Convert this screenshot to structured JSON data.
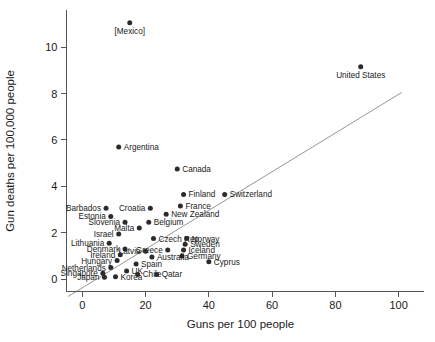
{
  "chart_data": {
    "type": "scatter",
    "title": "",
    "xlabel": "Guns per 100 people",
    "ylabel": "Gun deaths per 100,000 people",
    "xlim": [
      -8,
      108
    ],
    "ylim": [
      -0.9,
      11.6
    ],
    "xticks": [
      0,
      20,
      40,
      60,
      80,
      100
    ],
    "yticks": [
      0,
      2,
      4,
      6,
      8,
      10
    ],
    "xtick_labels": [
      "0",
      "20",
      "40",
      "60",
      "80",
      "100"
    ],
    "ytick_labels": [
      "0",
      "2",
      "4",
      "6",
      "8",
      "10"
    ],
    "grid": false,
    "legend": "none",
    "trendline": {
      "name": "linear fit",
      "x": [
        -4.5,
        101
      ],
      "y": [
        -0.75,
        8.05
      ]
    },
    "points": [
      {
        "label": "[Mexico]",
        "x": 15.0,
        "y": 11.05,
        "label_pos": "below"
      },
      {
        "label": "United States",
        "x": 88.0,
        "y": 9.15,
        "label_pos": "below"
      },
      {
        "label": "Argentina",
        "x": 11.5,
        "y": 5.7,
        "label_pos": "right"
      },
      {
        "label": "Canada",
        "x": 30.0,
        "y": 4.75,
        "label_pos": "right"
      },
      {
        "label": "Switzerland",
        "x": 45.0,
        "y": 3.65,
        "label_pos": "right"
      },
      {
        "label": "Finland",
        "x": 32.0,
        "y": 3.65,
        "label_pos": "right"
      },
      {
        "label": "France",
        "x": 31.0,
        "y": 3.15,
        "label_pos": "right"
      },
      {
        "label": "Barbados",
        "x": 7.5,
        "y": 3.05,
        "label_pos": "left"
      },
      {
        "label": "Croatia",
        "x": 21.5,
        "y": 3.05,
        "label_pos": "left"
      },
      {
        "label": "New Zealand",
        "x": 26.5,
        "y": 2.8,
        "label_pos": "right"
      },
      {
        "label": "Estonia",
        "x": 9.0,
        "y": 2.7,
        "label_pos": "left"
      },
      {
        "label": "Slovenia",
        "x": 13.5,
        "y": 2.45,
        "label_pos": "left"
      },
      {
        "label": "Belgium",
        "x": 21.0,
        "y": 2.45,
        "label_pos": "right"
      },
      {
        "label": "Malta",
        "x": 18.0,
        "y": 2.2,
        "label_pos": "left"
      },
      {
        "label": "Israel",
        "x": 11.5,
        "y": 1.95,
        "label_pos": "left"
      },
      {
        "label": "Czech Rep.",
        "x": 22.5,
        "y": 1.75,
        "label_pos": "right"
      },
      {
        "label": "Norway",
        "x": 33.0,
        "y": 1.75,
        "label_pos": "right"
      },
      {
        "label": "Lithuania",
        "x": 8.5,
        "y": 1.55,
        "label_pos": "left"
      },
      {
        "label": "Sweden",
        "x": 32.5,
        "y": 1.5,
        "label_pos": "right"
      },
      {
        "label": "Denmark",
        "x": 13.5,
        "y": 1.3,
        "label_pos": "left"
      },
      {
        "label": "Greece",
        "x": 27.0,
        "y": 1.25,
        "label_pos": "left"
      },
      {
        "label": "Latvia",
        "x": 20.0,
        "y": 1.2,
        "label_pos": "left"
      },
      {
        "label": "Iceland",
        "x": 32.0,
        "y": 1.25,
        "label_pos": "right"
      },
      {
        "label": "Ireland",
        "x": 12.0,
        "y": 1.05,
        "label_pos": "left"
      },
      {
        "label": "Germany",
        "x": 31.5,
        "y": 1.0,
        "label_pos": "right"
      },
      {
        "label": "Australia",
        "x": 22.0,
        "y": 0.95,
        "label_pos": "right"
      },
      {
        "label": "Hungary",
        "x": 11.0,
        "y": 0.8,
        "label_pos": "left"
      },
      {
        "label": "Cyprus",
        "x": 40.0,
        "y": 0.75,
        "label_pos": "right"
      },
      {
        "label": "Spain",
        "x": 17.0,
        "y": 0.65,
        "label_pos": "right"
      },
      {
        "label": "Netherlands",
        "x": 9.0,
        "y": 0.5,
        "label_pos": "left"
      },
      {
        "label": "UK",
        "x": 14.0,
        "y": 0.35,
        "label_pos": "right"
      },
      {
        "label": "Singapore",
        "x": 6.5,
        "y": 0.25,
        "label_pos": "left"
      },
      {
        "label": "Korea",
        "x": 10.5,
        "y": 0.1,
        "label_pos": "right"
      },
      {
        "label": "Japan",
        "x": 7.0,
        "y": 0.08,
        "label_pos": "left"
      },
      {
        "label": "Chile",
        "x": 17.5,
        "y": 0.2,
        "label_pos": "right"
      },
      {
        "label": "Qatar",
        "x": 23.5,
        "y": 0.2,
        "label_pos": "right"
      }
    ]
  }
}
